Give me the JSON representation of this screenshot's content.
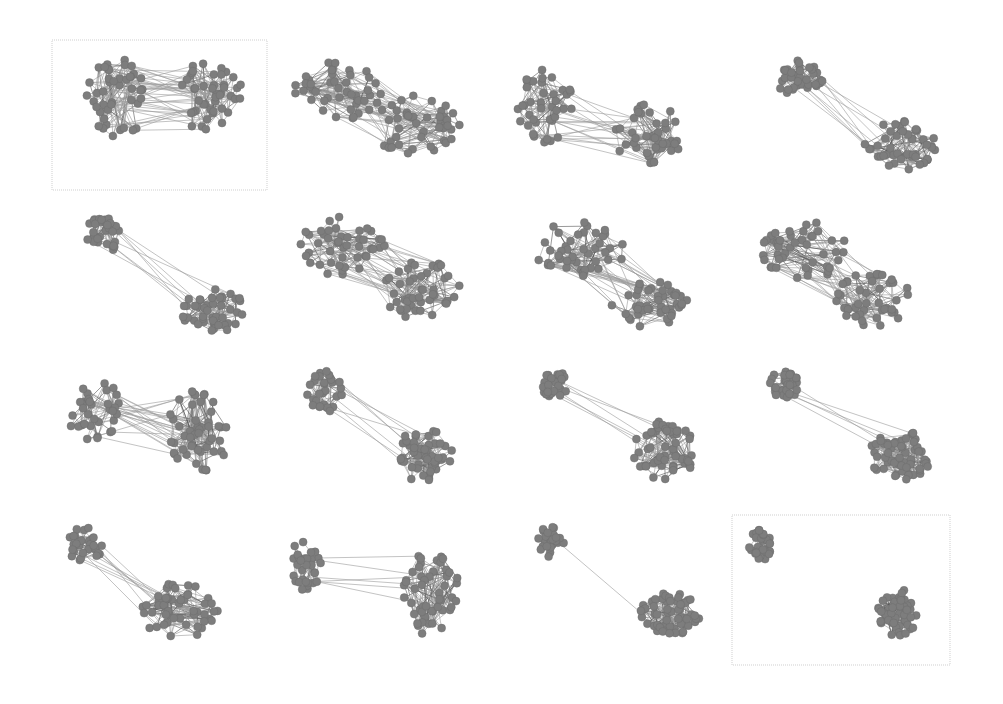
{
  "figure": {
    "node_color": "#7d7d7d",
    "edge_color": "#9a9a9a",
    "frame_color": "#cfcfcf",
    "panels": [
      {
        "x": 52,
        "y": 40,
        "w": 215,
        "h": 150,
        "framed": true,
        "clusters": [
          {
            "cx": 115,
            "cy": 100,
            "rx": 32,
            "ry": 42,
            "n": 45
          },
          {
            "cx": 210,
            "cy": 95,
            "rx": 32,
            "ry": 40,
            "n": 45
          }
        ],
        "bridge": 40,
        "seed": 1
      },
      {
        "x": 282,
        "y": 50,
        "w": 190,
        "h": 115,
        "framed": false,
        "clusters": [
          {
            "cx": 340,
            "cy": 90,
            "rx": 45,
            "ry": 32,
            "n": 45
          },
          {
            "cx": 415,
            "cy": 125,
            "rx": 45,
            "ry": 30,
            "n": 45
          }
        ],
        "bridge": 40,
        "seed": 2
      },
      {
        "x": 512,
        "y": 62,
        "w": 195,
        "h": 120,
        "framed": false,
        "clusters": [
          {
            "cx": 545,
            "cy": 105,
            "rx": 28,
            "ry": 38,
            "n": 40
          },
          {
            "cx": 650,
            "cy": 135,
            "rx": 35,
            "ry": 32,
            "n": 40
          }
        ],
        "bridge": 20,
        "seed": 3
      },
      {
        "x": 762,
        "y": 55,
        "w": 185,
        "h": 125,
        "framed": false,
        "clusters": [
          {
            "cx": 800,
            "cy": 78,
            "rx": 25,
            "ry": 18,
            "n": 35
          },
          {
            "cx": 900,
            "cy": 145,
            "rx": 38,
            "ry": 25,
            "n": 45
          }
        ],
        "bridge": 10,
        "seed": 4
      },
      {
        "x": 75,
        "y": 210,
        "w": 185,
        "h": 130,
        "framed": false,
        "clusters": [
          {
            "cx": 102,
            "cy": 235,
            "rx": 20,
            "ry": 18,
            "n": 35
          },
          {
            "cx": 215,
            "cy": 310,
            "rx": 35,
            "ry": 22,
            "n": 45
          }
        ],
        "bridge": 8,
        "seed": 5
      },
      {
        "x": 285,
        "y": 205,
        "w": 185,
        "h": 125,
        "framed": false,
        "clusters": [
          {
            "cx": 340,
            "cy": 245,
            "rx": 45,
            "ry": 30,
            "n": 45
          },
          {
            "cx": 420,
            "cy": 290,
            "rx": 40,
            "ry": 30,
            "n": 45
          }
        ],
        "bridge": 35,
        "seed": 6
      },
      {
        "x": 515,
        "y": 210,
        "w": 190,
        "h": 130,
        "framed": false,
        "clusters": [
          {
            "cx": 580,
            "cy": 250,
            "rx": 45,
            "ry": 30,
            "n": 45
          },
          {
            "cx": 650,
            "cy": 305,
            "rx": 40,
            "ry": 25,
            "n": 45
          }
        ],
        "bridge": 30,
        "seed": 7
      },
      {
        "x": 745,
        "y": 210,
        "w": 190,
        "h": 130,
        "framed": false,
        "clusters": [
          {
            "cx": 805,
            "cy": 250,
            "rx": 45,
            "ry": 30,
            "n": 45
          },
          {
            "cx": 875,
            "cy": 300,
            "rx": 40,
            "ry": 28,
            "n": 45
          }
        ],
        "bridge": 30,
        "seed": 8
      },
      {
        "x": 60,
        "y": 365,
        "w": 185,
        "h": 125,
        "framed": false,
        "clusters": [
          {
            "cx": 95,
            "cy": 410,
            "rx": 28,
            "ry": 32,
            "n": 35
          },
          {
            "cx": 200,
            "cy": 430,
            "rx": 32,
            "ry": 42,
            "n": 50
          }
        ],
        "bridge": 25,
        "seed": 9
      },
      {
        "x": 285,
        "y": 365,
        "w": 185,
        "h": 125,
        "framed": false,
        "clusters": [
          {
            "cx": 325,
            "cy": 390,
            "rx": 18,
            "ry": 22,
            "n": 30
          },
          {
            "cx": 425,
            "cy": 455,
            "rx": 30,
            "ry": 28,
            "n": 50
          }
        ],
        "bridge": 8,
        "seed": 10
      },
      {
        "x": 525,
        "y": 365,
        "w": 190,
        "h": 125,
        "framed": false,
        "clusters": [
          {
            "cx": 555,
            "cy": 385,
            "rx": 14,
            "ry": 14,
            "n": 30
          },
          {
            "cx": 665,
            "cy": 450,
            "rx": 32,
            "ry": 30,
            "n": 55
          }
        ],
        "bridge": 6,
        "seed": 11
      },
      {
        "x": 755,
        "y": 365,
        "w": 190,
        "h": 125,
        "framed": false,
        "clusters": [
          {
            "cx": 785,
            "cy": 385,
            "rx": 16,
            "ry": 14,
            "n": 30
          },
          {
            "cx": 900,
            "cy": 455,
            "rx": 32,
            "ry": 25,
            "n": 55
          }
        ],
        "bridge": 5,
        "seed": 12
      },
      {
        "x": 55,
        "y": 520,
        "w": 190,
        "h": 130,
        "framed": false,
        "clusters": [
          {
            "cx": 85,
            "cy": 545,
            "rx": 18,
            "ry": 18,
            "n": 30
          },
          {
            "cx": 180,
            "cy": 610,
            "rx": 40,
            "ry": 28,
            "n": 50
          }
        ],
        "bridge": 10,
        "seed": 13
      },
      {
        "x": 285,
        "y": 525,
        "w": 185,
        "h": 130,
        "framed": false,
        "clusters": [
          {
            "cx": 305,
            "cy": 565,
            "rx": 16,
            "ry": 25,
            "n": 30
          },
          {
            "cx": 430,
            "cy": 595,
            "rx": 30,
            "ry": 42,
            "n": 50
          }
        ],
        "bridge": 6,
        "seed": 14
      },
      {
        "x": 525,
        "y": 520,
        "w": 190,
        "h": 130,
        "framed": false,
        "clusters": [
          {
            "cx": 550,
            "cy": 542,
            "rx": 14,
            "ry": 15,
            "n": 30
          },
          {
            "cx": 670,
            "cy": 615,
            "rx": 30,
            "ry": 22,
            "n": 55
          }
        ],
        "bridge": 1,
        "seed": 15
      },
      {
        "x": 732,
        "y": 515,
        "w": 218,
        "h": 150,
        "framed": true,
        "clusters": [
          {
            "cx": 760,
            "cy": 545,
            "rx": 12,
            "ry": 16,
            "n": 30
          },
          {
            "cx": 897,
            "cy": 613,
            "rx": 20,
            "ry": 25,
            "n": 55
          }
        ],
        "bridge": 0,
        "seed": 16
      }
    ]
  }
}
